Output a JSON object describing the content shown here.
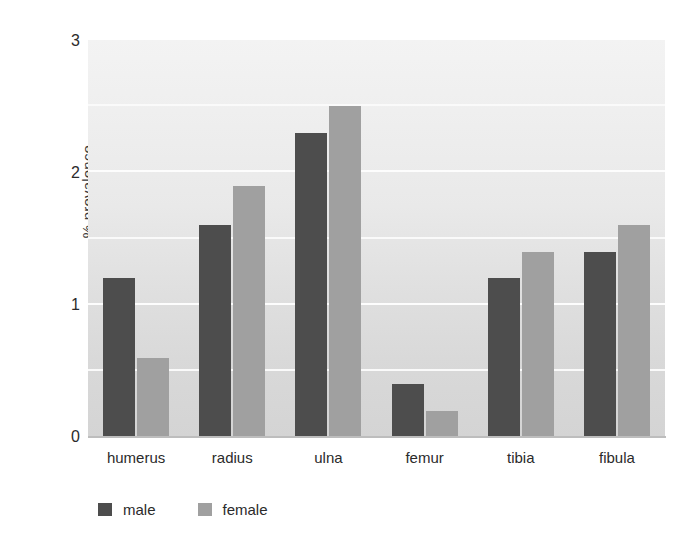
{
  "chart_data": {
    "type": "bar",
    "title": "",
    "subtitle": "",
    "xlabel": "",
    "ylabel": "% prevalence",
    "categories": [
      "humerus",
      "radius",
      "ulna",
      "femur",
      "tibia",
      "fibula"
    ],
    "series": [
      {
        "name": "male",
        "color": "#4d4d4d",
        "values": [
          1.2,
          1.6,
          2.3,
          0.4,
          1.2,
          1.4
        ]
      },
      {
        "name": "female",
        "color": "#a0a0a0",
        "values": [
          0.6,
          1.9,
          2.5,
          0.2,
          1.4,
          1.6
        ]
      }
    ],
    "ylim": [
      0,
      3
    ],
    "yticks": [
      "0",
      "1",
      "2",
      "3"
    ],
    "ytick_values": [
      0,
      1,
      2,
      3
    ],
    "minor_gridline_values": [
      0.5,
      1.5,
      2.5
    ],
    "grid": true,
    "grid_color": "#fdfdfd",
    "legend_position": "bottom-left",
    "plot_background": "#e8e8e8"
  },
  "legend": {
    "entries": [
      {
        "label": "male"
      },
      {
        "label": "female"
      }
    ]
  }
}
